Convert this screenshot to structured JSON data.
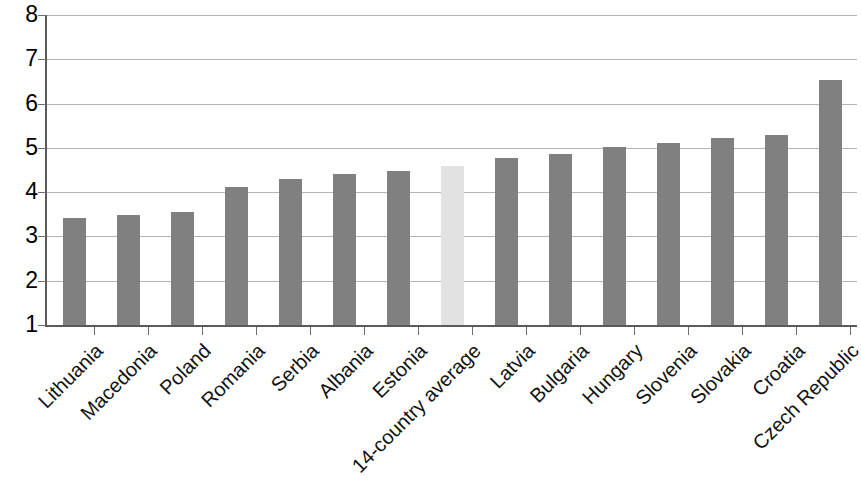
{
  "chart_data": {
    "type": "bar",
    "title": "",
    "subtitle": "",
    "xlabel": "",
    "ylabel": "",
    "ylim": [
      1,
      8
    ],
    "y_ticks": [
      1,
      2,
      3,
      4,
      5,
      6,
      7,
      8
    ],
    "y_tick_labels": [
      "1",
      "2",
      "3",
      "4",
      "5",
      "6",
      "7",
      "8"
    ],
    "grid": true,
    "legend": false,
    "legend_position": "none",
    "categories": [
      "Lithuania",
      "Macedonia",
      "Poland",
      "Romania",
      "Serbia",
      "Albania",
      "Estonia",
      "14-country average",
      "Latvia",
      "Bulgaria",
      "Hungary",
      "Slovenia",
      "Slovakia",
      "Croatia",
      "Czech Republic"
    ],
    "values": [
      3.42,
      3.49,
      3.56,
      4.12,
      4.3,
      4.4,
      4.47,
      4.6,
      4.78,
      4.86,
      5.01,
      5.11,
      5.22,
      5.29,
      6.54
    ],
    "bar_colors": [
      "#808080",
      "#808080",
      "#808080",
      "#808080",
      "#808080",
      "#808080",
      "#808080",
      "#e2e2e2",
      "#808080",
      "#808080",
      "#808080",
      "#808080",
      "#808080",
      "#808080",
      "#808080"
    ],
    "highlight_index": 7,
    "series": [
      {
        "name": "",
        "values": [
          3.42,
          3.49,
          3.56,
          4.12,
          4.3,
          4.4,
          4.47,
          4.6,
          4.78,
          4.86,
          5.01,
          5.11,
          5.22,
          5.29,
          6.54
        ]
      }
    ]
  },
  "colors": {
    "bar": "#808080",
    "bar_highlight": "#e2e2e2",
    "gridline": "#b4b4b4",
    "axis": "#5a5a5a",
    "text": "#111111",
    "background": "#ffffff"
  }
}
